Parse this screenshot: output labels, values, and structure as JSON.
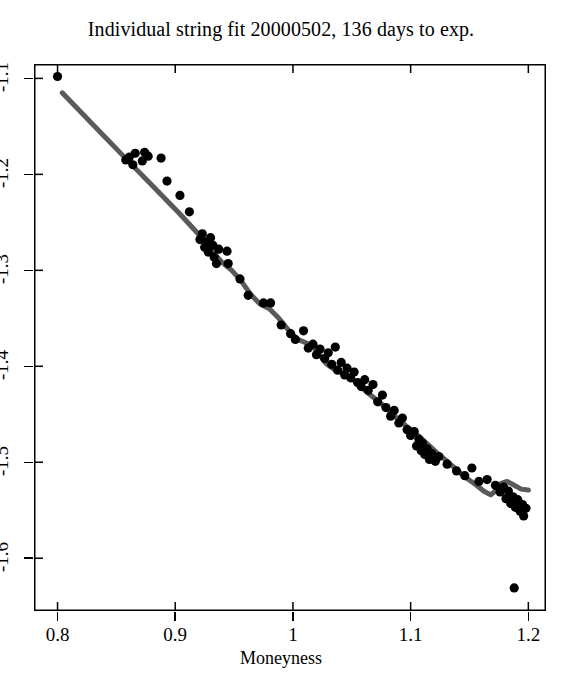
{
  "chart_data": {
    "type": "scatter",
    "title": "Individual string fit 20000502,  136 days to exp.",
    "xlabel": "Moneyness",
    "ylabel": "",
    "xlim": [
      0.78,
      1.215
    ],
    "ylim": [
      -1.655,
      -1.085
    ],
    "grid": false,
    "legend": "none",
    "xticks": [
      0.8,
      0.9,
      1.0,
      1.1,
      1.2
    ],
    "xtick_labels": [
      "0.8",
      "0.9",
      "1",
      "1.1",
      "1.2"
    ],
    "yticks": [
      -1.1,
      -1.2,
      -1.3,
      -1.4,
      -1.5,
      -1.6
    ],
    "ytick_labels": [
      "-1.1",
      "-1.2",
      "-1.3",
      "-1.4",
      "-1.5",
      "-1.6"
    ],
    "marker_color": "#000000",
    "line_color": "#5a5a5a",
    "frame_color": "#000000",
    "series": [
      {
        "name": "observed implied volatility",
        "type": "scatter",
        "marker": "filled-circle",
        "points": [
          [
            0.8,
            -1.098
          ],
          [
            0.858,
            -1.185
          ],
          [
            0.861,
            -1.182
          ],
          [
            0.864,
            -1.19
          ],
          [
            0.866,
            -1.178
          ],
          [
            0.872,
            -1.186
          ],
          [
            0.874,
            -1.177
          ],
          [
            0.877,
            -1.181
          ],
          [
            0.888,
            -1.183
          ],
          [
            0.893,
            -1.207
          ],
          [
            0.904,
            -1.222
          ],
          [
            0.912,
            -1.239
          ],
          [
            0.921,
            -1.268
          ],
          [
            0.923,
            -1.262
          ],
          [
            0.925,
            -1.276
          ],
          [
            0.927,
            -1.27
          ],
          [
            0.928,
            -1.281
          ],
          [
            0.93,
            -1.266
          ],
          [
            0.932,
            -1.274
          ],
          [
            0.933,
            -1.286
          ],
          [
            0.935,
            -1.293
          ],
          [
            0.937,
            -1.278
          ],
          [
            0.944,
            -1.28
          ],
          [
            0.945,
            -1.293
          ],
          [
            0.955,
            -1.309
          ],
          [
            0.962,
            -1.326
          ],
          [
            0.975,
            -1.334
          ],
          [
            0.981,
            -1.334
          ],
          [
            0.99,
            -1.357
          ],
          [
            0.998,
            -1.366
          ],
          [
            1.002,
            -1.372
          ],
          [
            1.009,
            -1.363
          ],
          [
            1.013,
            -1.381
          ],
          [
            1.017,
            -1.377
          ],
          [
            1.02,
            -1.388
          ],
          [
            1.023,
            -1.382
          ],
          [
            1.027,
            -1.392
          ],
          [
            1.03,
            -1.386
          ],
          [
            1.033,
            -1.398
          ],
          [
            1.036,
            -1.38
          ],
          [
            1.038,
            -1.404
          ],
          [
            1.041,
            -1.396
          ],
          [
            1.044,
            -1.409
          ],
          [
            1.046,
            -1.402
          ],
          [
            1.049,
            -1.412
          ],
          [
            1.052,
            -1.406
          ],
          [
            1.055,
            -1.417
          ],
          [
            1.058,
            -1.421
          ],
          [
            1.061,
            -1.414
          ],
          [
            1.064,
            -1.425
          ],
          [
            1.068,
            -1.419
          ],
          [
            1.072,
            -1.437
          ],
          [
            1.076,
            -1.43
          ],
          [
            1.079,
            -1.443
          ],
          [
            1.083,
            -1.452
          ],
          [
            1.086,
            -1.446
          ],
          [
            1.09,
            -1.459
          ],
          [
            1.093,
            -1.454
          ],
          [
            1.097,
            -1.466
          ],
          [
            1.1,
            -1.472
          ],
          [
            1.103,
            -1.468
          ],
          [
            1.105,
            -1.483
          ],
          [
            1.107,
            -1.476
          ],
          [
            1.109,
            -1.488
          ],
          [
            1.11,
            -1.48
          ],
          [
            1.112,
            -1.492
          ],
          [
            1.114,
            -1.486
          ],
          [
            1.116,
            -1.497
          ],
          [
            1.118,
            -1.491
          ],
          [
            1.121,
            -1.499
          ],
          [
            1.124,
            -1.494
          ],
          [
            1.131,
            -1.502
          ],
          [
            1.139,
            -1.509
          ],
          [
            1.146,
            -1.514
          ],
          [
            1.152,
            -1.506
          ],
          [
            1.158,
            -1.52
          ],
          [
            1.165,
            -1.518
          ],
          [
            1.172,
            -1.524
          ],
          [
            1.176,
            -1.531
          ],
          [
            1.179,
            -1.526
          ],
          [
            1.181,
            -1.538
          ],
          [
            1.183,
            -1.53
          ],
          [
            1.185,
            -1.543
          ],
          [
            1.187,
            -1.536
          ],
          [
            1.189,
            -1.547
          ],
          [
            1.191,
            -1.539
          ],
          [
            1.193,
            -1.551
          ],
          [
            1.195,
            -1.544
          ],
          [
            1.196,
            -1.556
          ],
          [
            1.198,
            -1.548
          ],
          [
            1.188,
            -1.631
          ]
        ]
      },
      {
        "name": "string fit",
        "type": "line",
        "points": [
          [
            0.804,
            -1.115
          ],
          [
            0.83,
            -1.148
          ],
          [
            0.856,
            -1.181
          ],
          [
            0.88,
            -1.211
          ],
          [
            0.903,
            -1.24
          ],
          [
            0.921,
            -1.264
          ],
          [
            0.932,
            -1.281
          ],
          [
            0.94,
            -1.292
          ],
          [
            0.948,
            -1.3
          ],
          [
            0.956,
            -1.311
          ],
          [
            0.964,
            -1.325
          ],
          [
            0.972,
            -1.335
          ],
          [
            0.98,
            -1.34
          ],
          [
            0.988,
            -1.35
          ],
          [
            0.996,
            -1.362
          ],
          [
            1.004,
            -1.372
          ],
          [
            1.012,
            -1.376
          ],
          [
            1.02,
            -1.383
          ],
          [
            1.028,
            -1.397
          ],
          [
            1.036,
            -1.404
          ],
          [
            1.044,
            -1.408
          ],
          [
            1.052,
            -1.415
          ],
          [
            1.06,
            -1.424
          ],
          [
            1.068,
            -1.432
          ],
          [
            1.076,
            -1.44
          ],
          [
            1.084,
            -1.449
          ],
          [
            1.092,
            -1.458
          ],
          [
            1.1,
            -1.466
          ],
          [
            1.108,
            -1.474
          ],
          [
            1.116,
            -1.483
          ],
          [
            1.124,
            -1.492
          ],
          [
            1.132,
            -1.5
          ],
          [
            1.14,
            -1.509
          ],
          [
            1.148,
            -1.517
          ],
          [
            1.156,
            -1.524
          ],
          [
            1.162,
            -1.53
          ],
          [
            1.168,
            -1.534
          ],
          [
            1.172,
            -1.53
          ],
          [
            1.177,
            -1.522
          ],
          [
            1.182,
            -1.52
          ],
          [
            1.188,
            -1.524
          ],
          [
            1.194,
            -1.528
          ],
          [
            1.2,
            -1.529
          ]
        ]
      }
    ]
  }
}
